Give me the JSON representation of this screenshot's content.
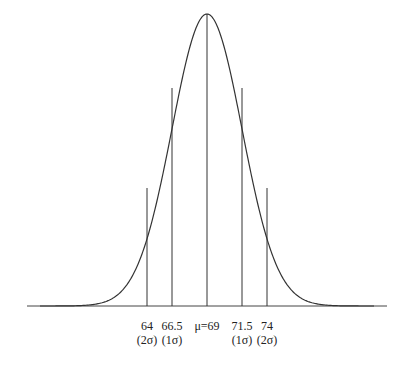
{
  "chart_data": {
    "type": "line",
    "title": "",
    "mean": 69,
    "sd": 2.5,
    "xlabel": "",
    "ylabel": "",
    "grid": false,
    "markers": [
      {
        "value": "64",
        "note": "(2σ)"
      },
      {
        "value": "66.5",
        "note": "(1σ)"
      },
      {
        "value": "μ=69",
        "note": ""
      },
      {
        "value": "71.5",
        "note": "(1σ)"
      },
      {
        "value": "74",
        "note": "(2σ)"
      }
    ],
    "x_range": [
      61.5,
      76.5
    ]
  },
  "labels": {
    "m2_value": "64",
    "m2_note": "(2σ)",
    "m1_value": "66.5",
    "m1_note": "(1σ)",
    "mean": "μ=69",
    "p1_value": "71.5",
    "p1_note": "(1σ)",
    "p2_value": "74",
    "p2_note": "(2σ)"
  }
}
